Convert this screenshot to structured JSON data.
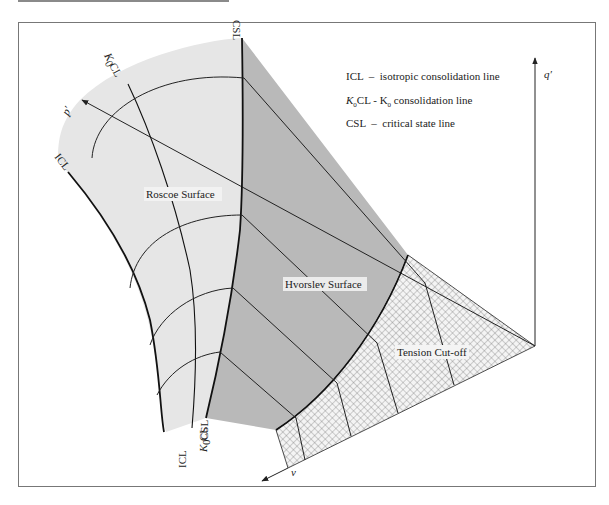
{
  "figure": {
    "colors": {
      "roscoe_fill": "#e6e6e6",
      "hvorslev_fill": "#b9b9b9",
      "tension_hatch": "#555555",
      "line": "#1a1a1a",
      "frame": "#777777"
    }
  },
  "legend": {
    "items": [
      {
        "abbr": "ICL",
        "sep": "–",
        "desc": "isotropic consolidation line"
      },
      {
        "abbr": "K0CL",
        "sep": "-",
        "desc": "K0 consolidation line"
      },
      {
        "abbr": "CSL",
        "sep": "–",
        "desc": "critical state line"
      }
    ],
    "line1": "ICL  –  isotropic consolidation line",
    "line2_prefix": "K",
    "line2_sub": "0",
    "line2_mid": "CL - K",
    "line2_sub2": "0",
    "line2_suffix": " consolidation line",
    "line3": "CSL  –  critical state line"
  },
  "axes": {
    "q": "q′",
    "p": "p′",
    "v": "v"
  },
  "surfaces": {
    "roscoe": "Roscoe Surface",
    "hvorslev": "Hvorslev Surface",
    "tension": "Tension Cut-off"
  },
  "line_labels": {
    "csl_top": "CSL",
    "k0cl_top_k": "K",
    "k0cl_top_sub": "0",
    "k0cl_top_cl": "CL",
    "icl_top": "ICL",
    "icl_bottom": "ICL",
    "k0cl_bottom_k": "K",
    "k0cl_bottom_sub": "0",
    "k0cl_bottom_cl": "CL",
    "csl_bottom": "CSL"
  }
}
